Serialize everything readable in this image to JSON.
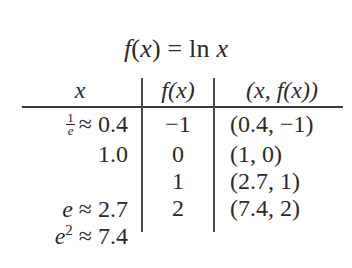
{
  "title": {
    "func": "f",
    "open": "(",
    "var": "x",
    "close": ")",
    "equals": " = ln ",
    "arg": "x"
  },
  "table": {
    "headers": [
      {
        "label": "x"
      },
      {
        "label": "f(x)"
      },
      {
        "label": "(x, f(x))"
      }
    ],
    "rows": [
      {
        "x_symbol_num": "1",
        "x_symbol_den": "e",
        "x_approx": "≈ 0.4",
        "fx": "−1",
        "point": "(0.4, −1)"
      },
      {
        "x_symbol": "",
        "x_approx": "1.0",
        "fx": "0",
        "point": "(1, 0)"
      },
      {
        "x_symbol": "e",
        "x_approx": " ≈ 2.7",
        "fx": "1",
        "point": "(2.7, 1)"
      },
      {
        "x_symbol": "e",
        "x_exp": "2",
        "x_approx": " ≈ 7.4",
        "fx": "2",
        "point": "(7.4, 2)"
      }
    ]
  }
}
